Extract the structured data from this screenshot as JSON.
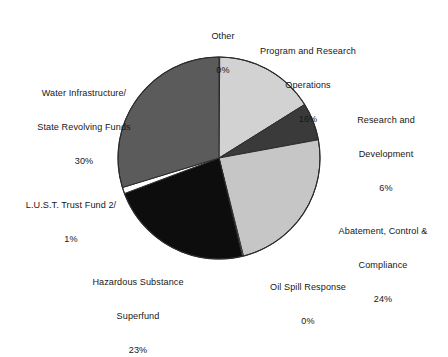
{
  "chart_data": {
    "type": "pie",
    "title": "",
    "subtitle": "",
    "xlabel": "",
    "ylabel": "",
    "legend_position": "none",
    "grid": false,
    "label_format": "name above percentage, placed outside slices",
    "start_angle_deg": 0,
    "direction": "clockwise",
    "center": {
      "x": 219,
      "y": 158
    },
    "radius": 101,
    "categories": [
      "Other",
      "Program and Research Operations",
      "Research and Development",
      "Abatement, Control & Compliance",
      "Oil Spill Response",
      "Hazardous Substance Superfund",
      "L.U.S.T. Trust Fund 2/",
      "Water Infrastructure/ State Revolving Funds"
    ],
    "values": [
      0,
      16,
      6,
      24,
      0,
      23,
      1,
      30
    ],
    "units": "percent",
    "slices": [
      {
        "name": "Other",
        "value": 0,
        "pct_label": "0%",
        "color": "#ffffff",
        "start_deg": 0.0,
        "end_deg": 0.4
      },
      {
        "name": "Program and Research Operations",
        "value": 16,
        "pct_label": "16%",
        "color": "#d2d2d2",
        "start_deg": 0.4,
        "end_deg": 58.0
      },
      {
        "name": "Research and Development",
        "value": 6,
        "pct_label": "6%",
        "color": "#3a3a3a",
        "start_deg": 58.0,
        "end_deg": 79.6
      },
      {
        "name": "Abatement, Control & Compliance",
        "value": 24,
        "pct_label": "24%",
        "color": "#c6c6c6",
        "start_deg": 79.6,
        "end_deg": 166.0
      },
      {
        "name": "Oil Spill Response",
        "value": 0,
        "pct_label": "0%",
        "color": "#ffffff",
        "start_deg": 166.0,
        "end_deg": 166.6
      },
      {
        "name": "Hazardous Substance Superfund",
        "value": 23,
        "pct_label": "23%",
        "color": "#0d0d0d",
        "start_deg": 166.6,
        "end_deg": 249.4
      },
      {
        "name": "L.U.S.T. Trust Fund 2/",
        "value": 1,
        "pct_label": "1%",
        "color": "#ffffff",
        "start_deg": 249.4,
        "end_deg": 253.0
      },
      {
        "name": "Water Infrastructure/ State Revolving Funds",
        "value": 30,
        "pct_label": "30%",
        "color": "#5b5b5b",
        "start_deg": 253.0,
        "end_deg": 360.0
      }
    ]
  },
  "labels": {
    "other": {
      "line1": "Other",
      "line2": "",
      "pct": "0%"
    },
    "pro": {
      "line1": "Program and Research",
      "line2": "Operations",
      "pct": "16%"
    },
    "rnd": {
      "line1": "Research and",
      "line2": "Development",
      "pct": "6%"
    },
    "acc": {
      "line1": "Abatement, Control &",
      "line2": "Compliance",
      "pct": "24%"
    },
    "oil": {
      "line1": "Oil Spill Response",
      "line2": "",
      "pct": "0%"
    },
    "haz": {
      "line1": "Hazardous Substance",
      "line2": "Superfund",
      "pct": "23%"
    },
    "lust": {
      "line1": "L.U.S.T. Trust Fund 2/",
      "line2": "",
      "pct": "1%"
    },
    "water": {
      "line1": "Water Infrastructure/",
      "line2": "State Revolving Funds",
      "pct": "30%"
    }
  },
  "colors": {
    "background": "#ffffff",
    "text": "#171717",
    "outline": "#2b2b2b",
    "light_gray": "#d2d2d2",
    "light_gray_2": "#c6c6c6",
    "mid_gray": "#5b5b5b",
    "dark_gray": "#3a3a3a",
    "black": "#0d0d0d",
    "white": "#ffffff"
  }
}
